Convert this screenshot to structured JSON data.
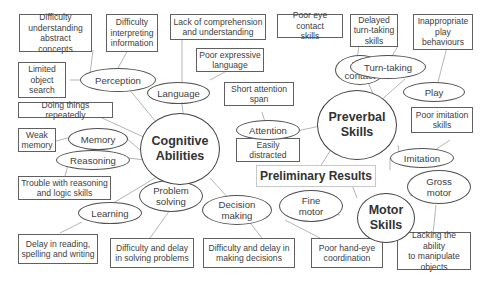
{
  "diagram": {
    "title": "Preliminary Results",
    "hubs": {
      "cognitive": "Cognitive\nAbilities",
      "preverbal": "Preverbal\nSkills",
      "motor": "Motor\nSkills"
    },
    "nodes": {
      "perception": "Perception",
      "language": "Language",
      "attention": "Attention",
      "memory": "Memory",
      "reasoning": "Reasoning",
      "learning": "Learning",
      "problem_solving": "Problem\nsolving",
      "decision_making": "Decision\nmaking",
      "eye_contact": "Eye\ncontact",
      "turn_taking": "Turn-taking",
      "play": "Play",
      "imitation": "Imitation",
      "fine_motor": "Fine\nmotor",
      "gross_motor": "Gross\nmotor"
    },
    "boxes": {
      "abstract": "Difficulty\nunderstanding\nabstract concepts",
      "interpreting": "Difficulty\ninterpreting\ninformation",
      "object_search": "Limited\nobject\nsearch",
      "comprehension": "Lack of comprehension\nand understanding",
      "expressive": "Poor expressive\nlanguage",
      "short_attention": "Short attention\nspan",
      "easily_distracted": "Easily\ndistracted",
      "repeatedly": "Doing things repeatedly",
      "weak_memory": "Weak\nmemory",
      "reasoning_trouble": "Trouble with reasoning\nand logic skills",
      "reading_delay": "Delay in reading,\nspelling and writing",
      "solving_delay": "Difficulty and delay\nin solving problems",
      "decisions_delay": "Difficulty and delay in\nmaking decisions",
      "eye_contact_poor": "Poor eye contact\nskills",
      "turn_taking_delayed": "Delayed\nturn-taking\nskills",
      "play_inappropriate": "Inappropriate\nplay\nbehaviours",
      "imitation_poor": "Poor imitation\nskills",
      "hand_eye": "Poor hand-eye\ncoordination",
      "manipulate": "Lacking the ability\nto manipulate\nobjects"
    },
    "colors": {
      "line": "#b0b0b0",
      "border": "#555555",
      "text": "#404040"
    }
  }
}
